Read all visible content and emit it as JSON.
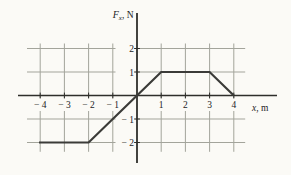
{
  "figure": {
    "y_axis_label": {
      "var": "F",
      "sub": "x",
      "unit": ", N"
    },
    "x_axis_label": {
      "var": "x",
      "unit": ", m"
    }
  },
  "chart_data": {
    "type": "line",
    "title": "",
    "ylabel": "Fx, N",
    "xlabel": "x, m",
    "xlim": [
      -4.55,
      4.45
    ],
    "ylim": [
      -2.4,
      2.2
    ],
    "grid": true,
    "legend": false,
    "x_ticks": [
      {
        "value": -4,
        "label": "− 4"
      },
      {
        "value": -3,
        "label": "− 3"
      },
      {
        "value": -2,
        "label": "− 2"
      },
      {
        "value": -1,
        "label": "− 1"
      },
      {
        "value": 1,
        "label": "1"
      },
      {
        "value": 2,
        "label": "2"
      },
      {
        "value": 3,
        "label": "3"
      },
      {
        "value": 4,
        "label": "4"
      }
    ],
    "y_ticks": [
      {
        "value": 2,
        "label": "2"
      },
      {
        "value": 1,
        "label": "1"
      },
      {
        "value": -1,
        "label": "− 1"
      },
      {
        "value": -2,
        "label": "− 2"
      }
    ],
    "series": [
      {
        "points": [
          [
            -4.05,
            -2
          ],
          [
            -2,
            -2
          ],
          [
            0,
            0
          ],
          [
            1,
            1
          ],
          [
            3,
            1
          ],
          [
            4,
            0
          ]
        ]
      }
    ]
  },
  "colors": {
    "background": "#fbfaf6",
    "grid": "#a3a49b",
    "axis": "#2e2e2b",
    "line": "#3b3b38",
    "text": "#23231e"
  }
}
